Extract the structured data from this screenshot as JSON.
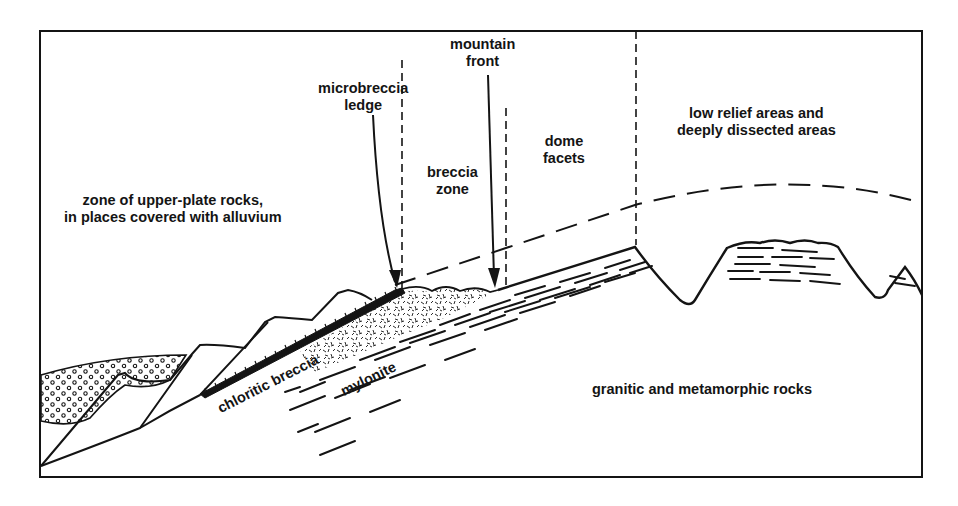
{
  "diagram": {
    "type": "geologic cross-section",
    "frame_color": "#141414",
    "background": "#ffffff",
    "labels": {
      "upper_plate": [
        "zone of upper-plate rocks,",
        "in places covered with alluvium"
      ],
      "microbreccia_ledge": [
        "microbreccia",
        "ledge"
      ],
      "mountain_front": [
        "mountain",
        "front"
      ],
      "breccia_zone": [
        "breccia",
        "zone"
      ],
      "dome_facets": [
        "dome",
        "facets"
      ],
      "low_relief": [
        "low relief areas and",
        "deeply dissected areas"
      ],
      "chloritic_breccia": "chloritic breccia",
      "mylonite": "mylonite",
      "granitic": "granitic and metamorphic rocks"
    },
    "zones": [
      "upper-plate rocks",
      "microbreccia ledge",
      "breccia zone",
      "dome facets",
      "low relief / dissected areas"
    ],
    "patterns": {
      "alluvium": "open circles (stippled)",
      "chloritic_breccia": "hatched band",
      "breccia": "random short dashes",
      "mylonite": "parallel dashed lines"
    }
  }
}
